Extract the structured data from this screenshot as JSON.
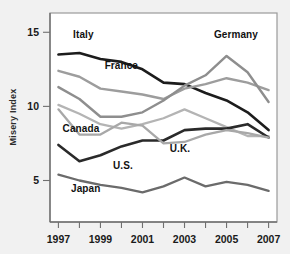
{
  "chart_data": {
    "type": "line",
    "title": "",
    "xlabel": "",
    "ylabel": "Misery Index",
    "x": [
      1997,
      1998,
      1999,
      2000,
      2001,
      2002,
      2003,
      2004,
      2005,
      2006,
      2007
    ],
    "xtick_labels": [
      "1997",
      "1999",
      "2001",
      "2003",
      "2005",
      "2007"
    ],
    "xtick_values": [
      1997,
      1999,
      2001,
      2003,
      2005,
      2007
    ],
    "ytick_labels": [
      "5",
      "10",
      "15"
    ],
    "ytick_values": [
      5,
      10,
      15
    ],
    "xlim": [
      1996.6,
      2007.4
    ],
    "ylim": [
      2.2,
      16.3
    ],
    "grid": false,
    "legend": "inline-labels",
    "series": [
      {
        "name": "Italy",
        "color": "#1c1c1c",
        "width": 2.6,
        "label": "Italy",
        "label_x": 1997.7,
        "label_y": 14.6,
        "values": [
          13.5,
          13.6,
          13.2,
          13.0,
          12.5,
          11.6,
          11.5,
          10.9,
          10.4,
          9.6,
          8.4
        ]
      },
      {
        "name": "France",
        "color": "#9d9d9d",
        "width": 2.4,
        "label": "France",
        "label_x": 1999.2,
        "label_y": 12.5,
        "values": [
          12.4,
          12.0,
          11.2,
          11.0,
          10.8,
          10.5,
          11.2,
          11.5,
          11.9,
          11.6,
          11.1
        ]
      },
      {
        "name": "Germany",
        "color": "#8e8e8e",
        "width": 2.4,
        "label": "Germany",
        "label_x": 2004.4,
        "label_y": 14.6,
        "values": [
          11.3,
          10.5,
          9.3,
          9.3,
          9.6,
          10.4,
          11.4,
          12.1,
          13.4,
          12.3,
          10.3
        ]
      },
      {
        "name": "U.K.",
        "color": "#b4b4b4",
        "width": 2.3,
        "label": "U.K.",
        "label_x": 2002.3,
        "label_y": 6.9,
        "values": [
          10.1,
          9.5,
          8.8,
          8.5,
          8.8,
          9.2,
          9.8,
          9.2,
          8.6,
          8.0,
          8.0
        ]
      },
      {
        "name": "Canada",
        "color": "#2a2a2a",
        "width": 2.6,
        "label": "Canada",
        "label_x": 1997.2,
        "label_y": 8.3,
        "values": [
          7.4,
          6.3,
          6.7,
          7.3,
          7.7,
          7.7,
          8.4,
          8.5,
          8.5,
          8.8,
          7.9
        ]
      },
      {
        "name": "U.S.",
        "color": "#a8a8a8",
        "width": 2.3,
        "label": "U.S.",
        "label_x": 1999.6,
        "label_y": 5.8,
        "values": [
          9.8,
          8.1,
          8.1,
          8.9,
          8.7,
          7.5,
          7.6,
          8.1,
          8.4,
          8.2,
          7.9
        ]
      },
      {
        "name": "Japan",
        "color": "#6b6b6b",
        "width": 2.3,
        "label": "Japan",
        "label_x": 1997.6,
        "label_y": 4.2,
        "values": [
          5.4,
          5.0,
          4.7,
          4.5,
          4.2,
          4.6,
          5.2,
          4.6,
          4.9,
          4.7,
          4.3
        ]
      }
    ]
  },
  "colors": {
    "page_background": "#f1f1f1",
    "plot_background": "#ffffff",
    "plot_border": "#9a9a9a",
    "axis": "#6f6f6f",
    "text": "#1a1a1a"
  }
}
